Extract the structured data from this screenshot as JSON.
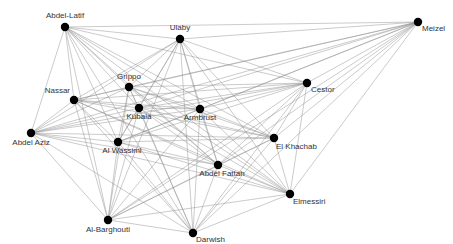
{
  "diagram": {
    "type": "network-graph",
    "nodes": [
      {
        "id": "abdel-latif",
        "label": "Abdel-Latif",
        "x": 65,
        "y": 27,
        "lx": 0,
        "ly": -9,
        "anchor": "middle"
      },
      {
        "id": "ulaby",
        "label": "Ulaby",
        "x": 180,
        "y": 39,
        "lx": 0,
        "ly": -9,
        "anchor": "middle"
      },
      {
        "id": "meizel",
        "label": "Meizel",
        "x": 418,
        "y": 22,
        "lx": 4,
        "ly": 9,
        "anchor": "start"
      },
      {
        "id": "grippo",
        "label": "Grippo",
        "x": 129,
        "y": 87,
        "lx": 0,
        "ly": -8,
        "anchor": "middle"
      },
      {
        "id": "nassar",
        "label": "Nassar",
        "x": 74,
        "y": 100,
        "lx": -4,
        "ly": -7,
        "anchor": "end"
      },
      {
        "id": "kubala",
        "label": "Kubala",
        "x": 139,
        "y": 108,
        "lx": 0,
        "ly": 11,
        "anchor": "middle"
      },
      {
        "id": "armbrust",
        "label": "Armbrust",
        "x": 200,
        "y": 109,
        "lx": 0,
        "ly": 11,
        "anchor": "middle"
      },
      {
        "id": "cestor",
        "label": "Cestor",
        "x": 307,
        "y": 83,
        "lx": 4,
        "ly": 9,
        "anchor": "start"
      },
      {
        "id": "abdel-aziz",
        "label": "Abdel Aziz",
        "x": 31,
        "y": 133,
        "lx": 0,
        "ly": 12,
        "anchor": "middle"
      },
      {
        "id": "al-wassimi",
        "label": "Al Wassimi",
        "x": 118,
        "y": 142,
        "lx": 4,
        "ly": 11,
        "anchor": "middle"
      },
      {
        "id": "el-khachab",
        "label": "El Khachab",
        "x": 274,
        "y": 138,
        "lx": 2,
        "ly": 11,
        "anchor": "start"
      },
      {
        "id": "abdel-fattah",
        "label": "Abdel Fattah",
        "x": 218,
        "y": 165,
        "lx": 4,
        "ly": 11,
        "anchor": "middle"
      },
      {
        "id": "elmessiri",
        "label": "Elmessiri",
        "x": 290,
        "y": 194,
        "lx": 3,
        "ly": 10,
        "anchor": "start"
      },
      {
        "id": "al-barghouti",
        "label": "Al-Barghouti",
        "x": 108,
        "y": 220,
        "lx": 0,
        "ly": 12,
        "anchor": "middle"
      },
      {
        "id": "darwish",
        "label": "Darwish",
        "x": 193,
        "y": 233,
        "lx": 3,
        "ly": 9,
        "anchor": "start"
      }
    ],
    "edges": [
      [
        "abdel-latif",
        "ulaby"
      ],
      [
        "abdel-latif",
        "meizel"
      ],
      [
        "abdel-latif",
        "grippo"
      ],
      [
        "abdel-latif",
        "nassar"
      ],
      [
        "abdel-latif",
        "kubala"
      ],
      [
        "abdel-latif",
        "armbrust"
      ],
      [
        "abdel-latif",
        "cestor"
      ],
      [
        "abdel-latif",
        "abdel-aziz"
      ],
      [
        "abdel-latif",
        "al-wassimi"
      ],
      [
        "abdel-latif",
        "el-khachab"
      ],
      [
        "abdel-latif",
        "abdel-fattah"
      ],
      [
        "abdel-latif",
        "elmessiri"
      ],
      [
        "abdel-latif",
        "al-barghouti"
      ],
      [
        "abdel-latif",
        "darwish"
      ],
      [
        "ulaby",
        "meizel"
      ],
      [
        "ulaby",
        "grippo"
      ],
      [
        "ulaby",
        "nassar"
      ],
      [
        "ulaby",
        "kubala"
      ],
      [
        "ulaby",
        "armbrust"
      ],
      [
        "ulaby",
        "cestor"
      ],
      [
        "ulaby",
        "abdel-aziz"
      ],
      [
        "ulaby",
        "al-wassimi"
      ],
      [
        "ulaby",
        "el-khachab"
      ],
      [
        "ulaby",
        "abdel-fattah"
      ],
      [
        "ulaby",
        "elmessiri"
      ],
      [
        "ulaby",
        "al-barghouti"
      ],
      [
        "ulaby",
        "darwish"
      ],
      [
        "meizel",
        "grippo"
      ],
      [
        "meizel",
        "nassar"
      ],
      [
        "meizel",
        "kubala"
      ],
      [
        "meizel",
        "armbrust"
      ],
      [
        "meizel",
        "cestor"
      ],
      [
        "meizel",
        "abdel-aziz"
      ],
      [
        "meizel",
        "al-wassimi"
      ],
      [
        "meizel",
        "el-khachab"
      ],
      [
        "meizel",
        "abdel-fattah"
      ],
      [
        "meizel",
        "elmessiri"
      ],
      [
        "meizel",
        "al-barghouti"
      ],
      [
        "meizel",
        "darwish"
      ],
      [
        "grippo",
        "nassar"
      ],
      [
        "grippo",
        "kubala"
      ],
      [
        "grippo",
        "armbrust"
      ],
      [
        "grippo",
        "cestor"
      ],
      [
        "grippo",
        "abdel-aziz"
      ],
      [
        "grippo",
        "al-wassimi"
      ],
      [
        "grippo",
        "el-khachab"
      ],
      [
        "grippo",
        "abdel-fattah"
      ],
      [
        "grippo",
        "elmessiri"
      ],
      [
        "grippo",
        "al-barghouti"
      ],
      [
        "grippo",
        "darwish"
      ],
      [
        "nassar",
        "kubala"
      ],
      [
        "nassar",
        "armbrust"
      ],
      [
        "nassar",
        "cestor"
      ],
      [
        "nassar",
        "abdel-aziz"
      ],
      [
        "nassar",
        "al-wassimi"
      ],
      [
        "nassar",
        "el-khachab"
      ],
      [
        "nassar",
        "abdel-fattah"
      ],
      [
        "nassar",
        "elmessiri"
      ],
      [
        "nassar",
        "al-barghouti"
      ],
      [
        "nassar",
        "darwish"
      ],
      [
        "kubala",
        "armbrust"
      ],
      [
        "kubala",
        "cestor"
      ],
      [
        "kubala",
        "abdel-aziz"
      ],
      [
        "kubala",
        "al-wassimi"
      ],
      [
        "kubala",
        "el-khachab"
      ],
      [
        "kubala",
        "abdel-fattah"
      ],
      [
        "kubala",
        "elmessiri"
      ],
      [
        "kubala",
        "al-barghouti"
      ],
      [
        "kubala",
        "darwish"
      ],
      [
        "armbrust",
        "cestor"
      ],
      [
        "armbrust",
        "abdel-aziz"
      ],
      [
        "armbrust",
        "al-wassimi"
      ],
      [
        "armbrust",
        "el-khachab"
      ],
      [
        "armbrust",
        "abdel-fattah"
      ],
      [
        "armbrust",
        "elmessiri"
      ],
      [
        "armbrust",
        "al-barghouti"
      ],
      [
        "armbrust",
        "darwish"
      ],
      [
        "cestor",
        "abdel-aziz"
      ],
      [
        "cestor",
        "al-wassimi"
      ],
      [
        "cestor",
        "el-khachab"
      ],
      [
        "cestor",
        "abdel-fattah"
      ],
      [
        "cestor",
        "elmessiri"
      ],
      [
        "cestor",
        "al-barghouti"
      ],
      [
        "cestor",
        "darwish"
      ],
      [
        "abdel-aziz",
        "al-wassimi"
      ],
      [
        "abdel-aziz",
        "el-khachab"
      ],
      [
        "abdel-aziz",
        "abdel-fattah"
      ],
      [
        "abdel-aziz",
        "elmessiri"
      ],
      [
        "abdel-aziz",
        "al-barghouti"
      ],
      [
        "abdel-aziz",
        "darwish"
      ],
      [
        "al-wassimi",
        "el-khachab"
      ],
      [
        "al-wassimi",
        "abdel-fattah"
      ],
      [
        "al-wassimi",
        "elmessiri"
      ],
      [
        "al-wassimi",
        "al-barghouti"
      ],
      [
        "al-wassimi",
        "darwish"
      ],
      [
        "el-khachab",
        "abdel-fattah"
      ],
      [
        "el-khachab",
        "elmessiri"
      ],
      [
        "el-khachab",
        "al-barghouti"
      ],
      [
        "el-khachab",
        "darwish"
      ],
      [
        "abdel-fattah",
        "elmessiri"
      ],
      [
        "abdel-fattah",
        "al-barghouti"
      ],
      [
        "abdel-fattah",
        "darwish"
      ],
      [
        "elmessiri",
        "al-barghouti"
      ],
      [
        "elmessiri",
        "darwish"
      ],
      [
        "al-barghouti",
        "darwish"
      ]
    ],
    "colors": {
      "node": "#000000",
      "edge": "#8a8a8a",
      "label": "#333333",
      "background": "#ffffff"
    }
  }
}
